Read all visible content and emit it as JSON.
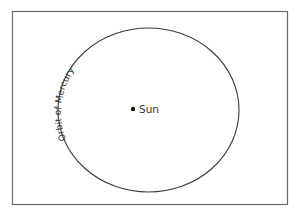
{
  "diagram": {
    "labels": {
      "orbit": "Orbit of Mercury",
      "sun": "Sun"
    },
    "colors": {
      "background": "#ffffff",
      "frame": "#6a6a6a",
      "orbit": "#3a3a3a",
      "text": "#333333",
      "sun": "#111111"
    }
  }
}
